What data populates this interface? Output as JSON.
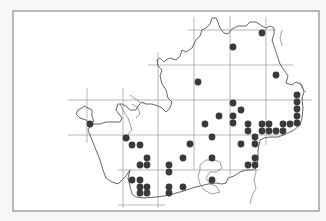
{
  "map": {
    "type": "distribution-dot-map",
    "frame": {
      "x": 13,
      "y": 11,
      "width": 306,
      "height": 200,
      "stroke": "#8a8a8a",
      "fill": "#ffffff"
    },
    "colors": {
      "background": "#f7f7f5",
      "outline": "#555555",
      "rivers": "#777777",
      "grid": "#9a9a9a",
      "dot": "#3a3a3a"
    },
    "grid": {
      "vertical": [
        {
          "x": 87,
          "y1": 88,
          "y2": 143
        },
        {
          "x": 123,
          "y1": 88,
          "y2": 208
        },
        {
          "x": 158,
          "y1": 52,
          "y2": 208
        },
        {
          "x": 194,
          "y1": 17,
          "y2": 170
        },
        {
          "x": 230,
          "y1": 16,
          "y2": 175
        },
        {
          "x": 266,
          "y1": 17,
          "y2": 145
        }
      ],
      "horizontal": [
        {
          "y": 30,
          "x1": 188,
          "x2": 276
        },
        {
          "y": 65,
          "x1": 148,
          "x2": 293
        },
        {
          "y": 100,
          "x1": 68,
          "x2": 312
        },
        {
          "y": 135,
          "x1": 68,
          "x2": 285
        },
        {
          "y": 170,
          "x1": 118,
          "x2": 260
        },
        {
          "y": 205,
          "x1": 118,
          "x2": 165
        }
      ]
    },
    "dot_radius": 3.4,
    "dots": [
      [
        262,
        33
      ],
      [
        233,
        47
      ],
      [
        276,
        75
      ],
      [
        198,
        82
      ],
      [
        297,
        95
      ],
      [
        297,
        102
      ],
      [
        297,
        109
      ],
      [
        297,
        116
      ],
      [
        297,
        123
      ],
      [
        233,
        103
      ],
      [
        241,
        110
      ],
      [
        219,
        116
      ],
      [
        233,
        116
      ],
      [
        233,
        123
      ],
      [
        205,
        124
      ],
      [
        248,
        124
      ],
      [
        248,
        131
      ],
      [
        262,
        124
      ],
      [
        269,
        124
      ],
      [
        283,
        124
      ],
      [
        290,
        124
      ],
      [
        262,
        131
      ],
      [
        269,
        131
      ],
      [
        276,
        131
      ],
      [
        283,
        131
      ],
      [
        90,
        124
      ],
      [
        126,
        138
      ],
      [
        132,
        145
      ],
      [
        140,
        145
      ],
      [
        212,
        137
      ],
      [
        190,
        144
      ],
      [
        241,
        144
      ],
      [
        255,
        137
      ],
      [
        255,
        144
      ],
      [
        147,
        158
      ],
      [
        183,
        158
      ],
      [
        212,
        158
      ],
      [
        255,
        158
      ],
      [
        140,
        165
      ],
      [
        147,
        165
      ],
      [
        169,
        165
      ],
      [
        169,
        172
      ],
      [
        248,
        165
      ],
      [
        255,
        165
      ],
      [
        132,
        180
      ],
      [
        140,
        180
      ],
      [
        212,
        180
      ],
      [
        140,
        187
      ],
      [
        147,
        187
      ],
      [
        169,
        187
      ],
      [
        183,
        187
      ],
      [
        140,
        193
      ],
      [
        147,
        193
      ],
      [
        169,
        193
      ]
    ]
  }
}
